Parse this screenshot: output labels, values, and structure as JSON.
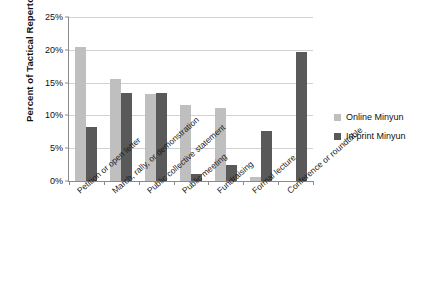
{
  "chart_data": {
    "type": "bar",
    "title": "",
    "xlabel": "",
    "ylabel": "Percent of Tactical Repertoire",
    "ylim": [
      0,
      25
    ],
    "ytick_labels": [
      "25%",
      "20%",
      "15%",
      "10%",
      "5%",
      "0%"
    ],
    "ytick_values": [
      25,
      20,
      15,
      10,
      5,
      0
    ],
    "grid": "horizontal",
    "legend_position": "right",
    "categories": [
      "Petition or open letter",
      "March, rally, or demonstration",
      "Public collective statement",
      "Public meeting",
      "Fundraising",
      "Formal lecture",
      "Conference or roundtable"
    ],
    "series": [
      {
        "name": "Online Minyun",
        "color": "#bfbfbf",
        "values": [
          20.5,
          15.6,
          13.3,
          11.6,
          11.1,
          0.6,
          0.0
        ]
      },
      {
        "name": "In-print Minyun",
        "color": "#595959",
        "values": [
          8.2,
          13.4,
          13.4,
          1.0,
          2.4,
          7.7,
          19.7
        ]
      }
    ]
  },
  "legend": {
    "items": [
      {
        "label": "Online Minyun"
      },
      {
        "label": "In-print Minyun"
      }
    ]
  }
}
